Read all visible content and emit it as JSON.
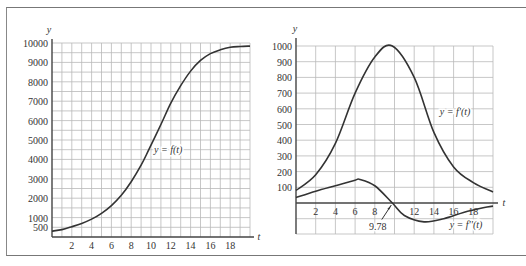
{
  "chart_data": [
    {
      "type": "line",
      "title": "",
      "xlabel": "t",
      "ylabel": "y",
      "xlim": [
        0,
        20
      ],
      "ylim": [
        0,
        10000
      ],
      "x_ticks": [
        "2",
        "4",
        "6",
        "8",
        "10",
        "12",
        "14",
        "16",
        "18"
      ],
      "y_ticks": [
        "500",
        "1000",
        "2000",
        "3000",
        "4000",
        "5000",
        "6000",
        "7000",
        "8000",
        "9000",
        "10000"
      ],
      "grid": true,
      "series": [
        {
          "name": "y = f(t)",
          "x": [
            0,
            1,
            2,
            3,
            4,
            5,
            6,
            7,
            8,
            9,
            9.78,
            11,
            12,
            13,
            14,
            15,
            16,
            17,
            18,
            19,
            20
          ],
          "values": [
            300,
            380,
            530,
            700,
            920,
            1220,
            1620,
            2150,
            2850,
            3700,
            4500,
            5800,
            6900,
            7800,
            8550,
            9100,
            9450,
            9650,
            9780,
            9820,
            9840
          ]
        }
      ],
      "annotations": [
        {
          "text": "y = f(t)",
          "x": 10.2,
          "y": 4500
        }
      ]
    },
    {
      "type": "line",
      "title": "",
      "xlabel": "t",
      "ylabel": "y",
      "xlim": [
        0,
        20
      ],
      "ylim": [
        -200,
        1000
      ],
      "x_ticks": [
        "2",
        "4",
        "6",
        "8",
        "12",
        "14",
        "16",
        "18"
      ],
      "y_ticks": [
        "100",
        "200",
        "300",
        "400",
        "500",
        "600",
        "700",
        "800",
        "900",
        "1000"
      ],
      "grid": true,
      "series": [
        {
          "name": "y = f'(t)",
          "x": [
            0,
            2,
            4,
            6,
            8,
            9.78,
            12,
            14,
            16,
            18,
            20
          ],
          "values": [
            80,
            180,
            380,
            700,
            930,
            1000,
            800,
            450,
            230,
            130,
            70
          ]
        },
        {
          "name": "y = f''(t)",
          "x": [
            0,
            2,
            4,
            6,
            6.5,
            8,
            9.78,
            11,
            13,
            15,
            17,
            19,
            20
          ],
          "values": [
            35,
            75,
            110,
            145,
            150,
            110,
            0,
            -80,
            -120,
            -100,
            -60,
            -30,
            -20
          ]
        }
      ],
      "annotations": [
        {
          "text": "y = f'(t)",
          "x": 14.6,
          "y": 580
        },
        {
          "text": "y = f''(t)",
          "x": 15.6,
          "y": -140
        },
        {
          "text": "9.78",
          "x": 8.3,
          "y": -150,
          "arrow_to": [
            9.78,
            0
          ]
        }
      ]
    }
  ],
  "left": {
    "y_axis_label": "y",
    "x_axis_label": "t",
    "curve_label": "y = f(t)"
  },
  "right": {
    "y_axis_label": "y",
    "x_axis_label": "t",
    "curve1_label": "y = f'(t)",
    "curve2_label": "y = f''(t)",
    "inflection_label": "9.78"
  }
}
